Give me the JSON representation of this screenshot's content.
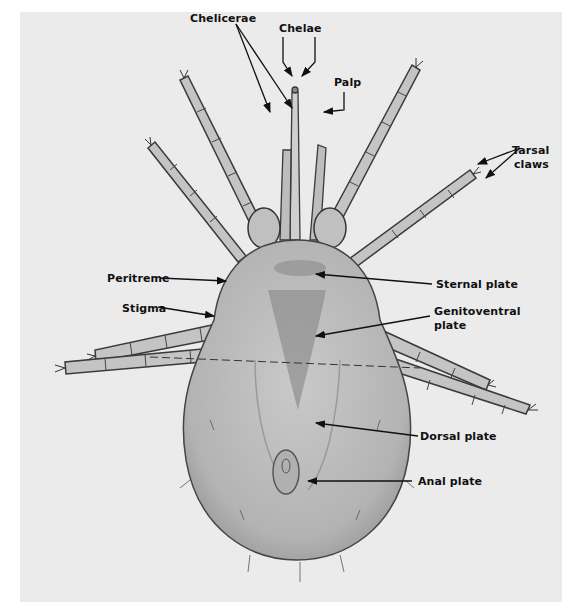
{
  "figure": {
    "background_color": "#ebebeb",
    "specimen_color": "#b8b8b8",
    "label_color": "#111111"
  },
  "labels": {
    "chelae": "Chelae",
    "chelicerae": "Chelicerae",
    "palp": "Palp",
    "tarsal_claws_line1": "Tarsal",
    "tarsal_claws_line2": "claws",
    "peritreme": "Peritreme",
    "stigma": "Stigma",
    "sternal_plate": "Sternal plate",
    "genitoventral_plate_line1": "Genitoventral",
    "genitoventral_plate_line2": "plate",
    "dorsal_plate": "Dorsal plate",
    "anal_plate": "Anal plate"
  }
}
